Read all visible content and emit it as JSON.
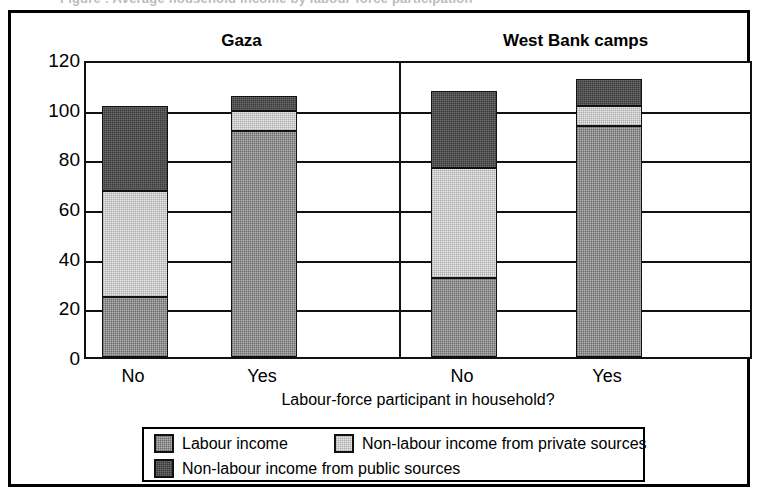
{
  "scan_artifact": {
    "text": "Figure : Average household income by labour-force participation"
  },
  "chart_data": {
    "type": "bar",
    "subtype": "stacked",
    "title": "",
    "xlabel": "Labour-force participant in household?",
    "ylabel": "",
    "ylim": [
      0,
      120
    ],
    "yticks": [
      0,
      20,
      40,
      60,
      80,
      100,
      120
    ],
    "grid": true,
    "legend_position": "bottom",
    "groups": [
      "Gaza",
      "West Bank camps"
    ],
    "categories": [
      "No",
      "Yes",
      "No",
      "Yes"
    ],
    "series": [
      {
        "name": "Labour income",
        "color": "#b4b4b4",
        "values": [
          24,
          91,
          32,
          93
        ]
      },
      {
        "name": "Non-labour income from private sources",
        "color": "#e8e8e8",
        "values": [
          43,
          8,
          44,
          8
        ]
      },
      {
        "name": "Non-labour income from public sources",
        "color": "#3a3a3a",
        "values": [
          34,
          6,
          31,
          11
        ]
      }
    ],
    "totals": [
      101,
      105,
      107,
      112
    ]
  },
  "axes": {
    "y": {
      "ticks": [
        "0",
        "20",
        "40",
        "60",
        "80",
        "100",
        "120"
      ]
    },
    "x": {
      "ticks": [
        "No",
        "Yes",
        "No",
        "Yes"
      ],
      "title": "Labour-force participant in household?"
    }
  },
  "groups": [
    {
      "label": "Gaza"
    },
    {
      "label": "West Bank camps"
    }
  ],
  "legend": {
    "items": [
      {
        "label": "Labour income",
        "swatch": "labour-income-swatch"
      },
      {
        "label": "Non-labour income from private sources",
        "swatch": "private-sources-swatch"
      },
      {
        "label": "Non-labour income from public sources",
        "swatch": "public-sources-swatch"
      }
    ]
  }
}
